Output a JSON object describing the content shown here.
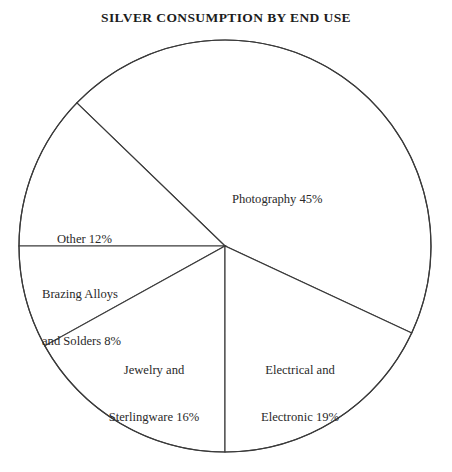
{
  "chart_data": {
    "type": "pie",
    "title": "SILVER CONSUMPTION BY END USE",
    "xlabel": "",
    "ylabel": "",
    "legend": "none",
    "grid": false,
    "units": "percent",
    "categories": [
      "Photography",
      "Other",
      "Brazing Alloys and Solders",
      "Jewelry and Sterlingware",
      "Electrical and Electronic"
    ],
    "values": [
      45,
      12,
      8,
      16,
      19
    ],
    "slices": [
      {
        "name": "photography",
        "label_line1": "Photography 45%",
        "label_line2": "",
        "value": 45,
        "value_text": "45%",
        "start_angle": -25,
        "end_angle": 136
      },
      {
        "name": "other",
        "label_line1": "Other 12%",
        "label_line2": "",
        "value": 12,
        "value_text": "12%",
        "start_angle": 136,
        "end_angle": 180
      },
      {
        "name": "brazing-alloys-and-solders",
        "label_line1": "Brazing Alloys",
        "label_line2": "and Solders 8%",
        "value": 8,
        "value_text": "8%",
        "start_angle": 180,
        "end_angle": 209
      },
      {
        "name": "jewelry-and-sterlingware",
        "label_line1": "Jewelry and",
        "label_line2": "Sterlingware 16%",
        "value": 16,
        "value_text": "16%",
        "start_angle": 209,
        "end_angle": 270
      },
      {
        "name": "electrical-and-electronic",
        "label_line1": "Electrical and",
        "label_line2": "Electronic 19%",
        "value": 19,
        "value_text": "19%",
        "start_angle": 270,
        "end_angle": 335
      }
    ],
    "geometry": {
      "center_x": 225,
      "center_y": 246,
      "radius": 206
    },
    "colors": {
      "slice_fill": "#ffffff",
      "slice_stroke": "#3a3a3a",
      "text": "#2a2a2a",
      "title": "#1c1c1c",
      "background": "#ffffff"
    }
  }
}
